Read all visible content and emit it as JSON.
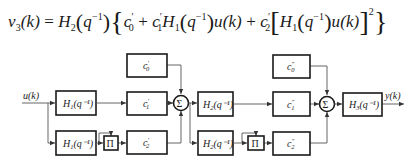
{
  "formula": {
    "lhs": "v",
    "lhs_sub": "3",
    "lhs_arg": "(k)",
    "equals": "=",
    "h2": "H",
    "h2_sub": "2",
    "q_arg": "q",
    "q_exp": "−1",
    "c0": "c",
    "c0_sub": "0",
    "c1": "c",
    "c1_sub": "1",
    "h1": "H",
    "h1_sub": "1",
    "u": "u(k)",
    "c2": "c",
    "c2_sub": "2",
    "square": "2",
    "prime": "′",
    "plus": "+"
  },
  "diagram": {
    "input_label": "u(k)",
    "output_label": "y(k)",
    "stage1": {
      "h_top": {
        "name": "H",
        "sub": "1",
        "arg": "(q⁻¹)"
      },
      "h_bottom": {
        "name": "H",
        "sub": "1",
        "arg": "(q⁻¹)"
      },
      "product": "Π",
      "c0": {
        "name": "c",
        "sub": "0",
        "mark": "′"
      },
      "c1": {
        "name": "c",
        "sub": "1",
        "mark": "′"
      },
      "c2": {
        "name": "c",
        "sub": "2",
        "mark": "′"
      },
      "sum": "Σ"
    },
    "stage2": {
      "h_top": {
        "name": "H",
        "sub": "2",
        "arg": "(q⁻¹)"
      },
      "h_bottom": {
        "name": "H",
        "sub": "2",
        "arg": "(q⁻¹)"
      },
      "product": "Π",
      "c0": {
        "name": "c",
        "sub": "0",
        "mark": "″"
      },
      "c1": {
        "name": "c",
        "sub": "1",
        "mark": "″"
      },
      "c2": {
        "name": "c",
        "sub": "2",
        "mark": "″"
      },
      "sum": "Σ"
    },
    "output_block": {
      "name": "H",
      "sub": "3",
      "arg": "(q⁻¹)"
    }
  }
}
